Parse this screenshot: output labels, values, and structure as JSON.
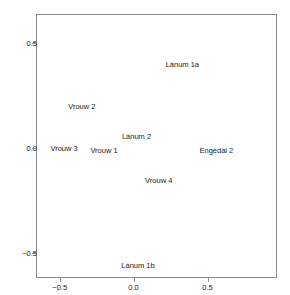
{
  "chart_data": {
    "type": "scatter",
    "title": "",
    "subtitle": "",
    "xlabel": "",
    "ylabel": "",
    "xlim": [
      -0.66,
      0.97
    ],
    "ylim": [
      -0.62,
      0.64
    ],
    "grid": false,
    "legend": null,
    "marker_style": "text-label-only",
    "points": [
      {
        "label": "Lánum 1a",
        "x": 0.33,
        "y": 0.4
      },
      {
        "label": "Vrouw 2",
        "x": -0.35,
        "y": 0.2
      },
      {
        "label": "Lánum 2",
        "x": 0.02,
        "y": 0.06
      },
      {
        "label": "Vrouw 3",
        "x": -0.47,
        "y": 0.0
      },
      {
        "label": "Vrouw 1",
        "x": -0.2,
        "y": -0.01
      },
      {
        "label": "Engedal 2",
        "x": 0.56,
        "y": -0.01
      },
      {
        "label": "Vrouw 4",
        "x": 0.17,
        "y": -0.15
      },
      {
        "label": "Lánum 1b",
        "x": 0.03,
        "y": -0.56
      }
    ],
    "xticks": [
      {
        "value": -0.5,
        "label": "−0.5"
      },
      {
        "value": 0.0,
        "label": "0.0"
      },
      {
        "value": 0.5,
        "label": "0.5"
      }
    ],
    "yticks": [
      {
        "value": 0.5,
        "label": "0.5"
      },
      {
        "value": 0.0,
        "label": "0.0"
      },
      {
        "value": -0.5,
        "label": "−0.5"
      }
    ],
    "colors": {
      "background": "#ffffff",
      "frame": "#8c8c8c",
      "text": "#1a1a1a"
    }
  }
}
